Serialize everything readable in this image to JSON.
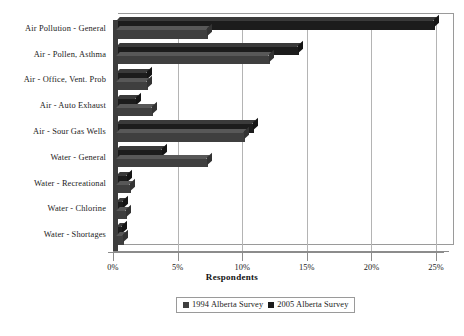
{
  "chart_data": {
    "type": "bar",
    "orientation": "horizontal",
    "title": "",
    "xlabel": "Respondents",
    "ylabel": "",
    "xlim": [
      0,
      26
    ],
    "xticks": [
      "0%",
      "5%",
      "10%",
      "15%",
      "20%",
      "25%"
    ],
    "xtick_values": [
      0,
      5,
      10,
      15,
      20,
      25
    ],
    "grid": true,
    "legend_position": "bottom",
    "categories": [
      "Air Pollution - General",
      "Air - Pollen, Asthma",
      "Air - Office, Vent. Prob",
      "Air - Auto Exhaust",
      "Air - Sour Gas Wells",
      "Water - General",
      "Water - Recreational",
      "Water - Chlorine",
      "Water - Shortages"
    ],
    "series": [
      {
        "name": "1994 Alberta Survey",
        "color": "#3f3f3f",
        "values": [
          7.0,
          11.8,
          2.3,
          2.7,
          9.8,
          7.0,
          1.0,
          0.7,
          0.5
        ]
      },
      {
        "name": "2005 Alberta Survey",
        "color": "#1c1c1c",
        "values": [
          24.5,
          14.0,
          2.3,
          1.5,
          10.5,
          3.5,
          0.8,
          0.5,
          0.4
        ]
      }
    ]
  },
  "axis": {
    "x_title": "Respondents",
    "tick_labels": [
      "0%",
      "5%",
      "10%",
      "15%",
      "20%",
      "25%"
    ]
  },
  "legend": {
    "entries": [
      {
        "label": "1994 Alberta Survey",
        "color": "#3f3f3f"
      },
      {
        "label": "2005 Alberta Survey",
        "color": "#1c1c1c"
      }
    ]
  },
  "colors": {
    "series_1994": "#3f3f3f",
    "series_2005": "#1c1c1c",
    "gridline": "#b4b4b4",
    "frame": "#9a9a9a",
    "background": "#ffffff",
    "text": "#1a1a1a"
  }
}
